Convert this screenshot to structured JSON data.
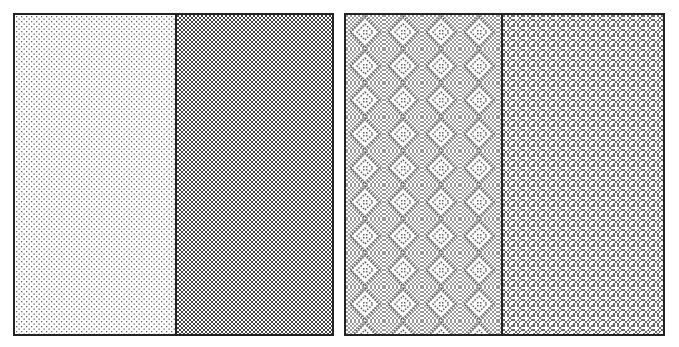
{
  "figure": {
    "panels": [
      {
        "id": "left",
        "halves": [
          {
            "pattern": "fine-dots",
            "color": "#555555"
          },
          {
            "pattern": "dense-dots",
            "color": "#333333"
          }
        ]
      },
      {
        "id": "right",
        "halves": [
          {
            "pattern": "diamond-lattice",
            "color": "#444444"
          },
          {
            "pattern": "textured-weave",
            "color": "#444444"
          }
        ]
      }
    ]
  }
}
